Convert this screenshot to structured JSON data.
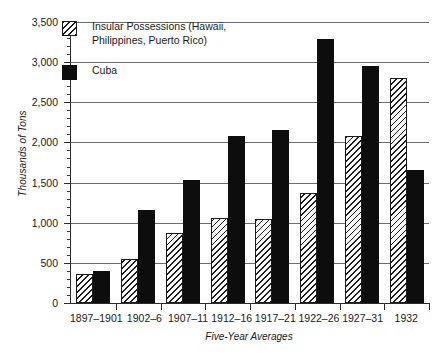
{
  "chart_data": {
    "type": "bar",
    "title": "",
    "xlabel": "Five-Year Averages",
    "ylabel": "Thousands of Tons",
    "ylim": [
      0,
      3500
    ],
    "ytick_step": 500,
    "yticks": [
      "0",
      "500",
      "1,000",
      "1,500",
      "2,000",
      "2,500",
      "3,000",
      "3,500"
    ],
    "grid": true,
    "legend_position": "top-left",
    "categories": [
      "1897–1901",
      "1902–6",
      "1907–11",
      "1912–16",
      "1917–21",
      "1922–26",
      "1927–31",
      "1932"
    ],
    "series": [
      {
        "name": "Insular Possessions (Hawaii,\nPhilippines, Puerto Rico)",
        "legend_label": "Insular Possessions (Hawaii,\nPhilippines, Puerto Rico)",
        "style": "hatched",
        "values": [
          360,
          550,
          870,
          1060,
          1050,
          1370,
          2080,
          2800
        ]
      },
      {
        "name": "Cuba",
        "legend_label": "Cuba",
        "style": "solid-black",
        "values": [
          400,
          1160,
          1530,
          2080,
          2150,
          3290,
          2950,
          1660
        ]
      }
    ]
  },
  "colors": {
    "series_cuba": "#0d0d0d",
    "series_insular_outline": "#1a1a1a",
    "gridline": "#6d6d6d",
    "axis": "#2b2b2b",
    "background": "#ffffff"
  }
}
